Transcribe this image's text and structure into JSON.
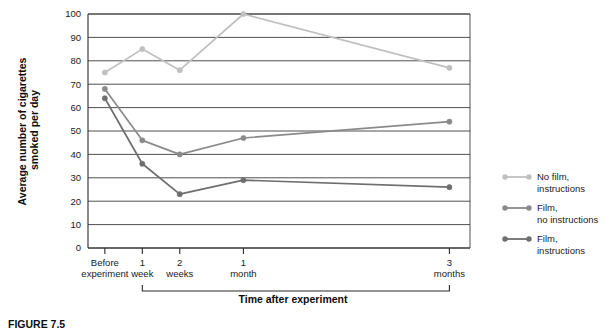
{
  "figure": {
    "caption": "FIGURE 7.5"
  },
  "chart_data": {
    "type": "line",
    "title": "",
    "xlabel": "Time after experiment",
    "ylabel": "Average number of cigarettes smoked per day",
    "categories": [
      "Before experiment",
      "1 week",
      "2 weeks",
      "1 month",
      "3 months"
    ],
    "category_lines": [
      [
        "Before",
        "experiment"
      ],
      [
        "1",
        "week"
      ],
      [
        "2",
        "weeks"
      ],
      [
        "1",
        "month"
      ],
      [
        "3",
        "months"
      ]
    ],
    "x_positions": [
      0,
      1,
      2,
      3.7,
      9.2
    ],
    "xlim": [
      -0.45,
      9.75
    ],
    "ylim": [
      0,
      100
    ],
    "yticks": [
      0,
      10,
      20,
      30,
      40,
      50,
      60,
      70,
      80,
      90,
      100
    ],
    "ytick_labels": [
      "0",
      "10",
      "20",
      "30",
      "40",
      "50",
      "60",
      "70",
      "80",
      "90",
      "100"
    ],
    "grid": true,
    "legend_position": "right",
    "series": [
      {
        "name": "No film, instructions",
        "name_lines": [
          "No film,",
          "instructions"
        ],
        "color": "#c0c0c0",
        "values": [
          75,
          85,
          76,
          100,
          77
        ]
      },
      {
        "name": "Film, no instructions",
        "name_lines": [
          "Film,",
          "no instructions"
        ],
        "color": "#8a8a8a",
        "values": [
          68,
          46,
          40,
          47,
          54
        ]
      },
      {
        "name": "Film, instructions",
        "name_lines": [
          "Film,",
          "instructions"
        ],
        "color": "#6e6e6e",
        "values": [
          64,
          36,
          23,
          29,
          26
        ]
      }
    ]
  }
}
